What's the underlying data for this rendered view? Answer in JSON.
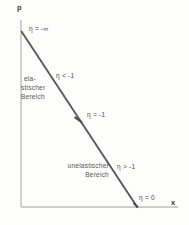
{
  "figure": {
    "type": "economics-diagram",
    "axes": {
      "y_label": "p",
      "x_label": "x",
      "color": "#b9b9b7"
    },
    "curve": {
      "main_color": "#58585a",
      "secondary_color": "#a9a9a7",
      "start": {
        "x": 21,
        "y": 31
      },
      "end": {
        "x": 137,
        "y": 207
      },
      "midpoint": {
        "x": 79,
        "y": 119
      }
    },
    "labels": {
      "eta_minus_infinity": "η = -∞",
      "eta_less_than_minus_one": "η < -1",
      "eta_equals_minus_one": "η = -1",
      "eta_greater_than_minus_one": "η > -1",
      "eta_equals_zero": "η = 0"
    },
    "regions": {
      "elastic": {
        "line1": "ela-",
        "line2": "stischer",
        "line3": "Bereich"
      },
      "inelastic": {
        "line1": "unelastischer",
        "line2": "Bereich"
      }
    }
  }
}
